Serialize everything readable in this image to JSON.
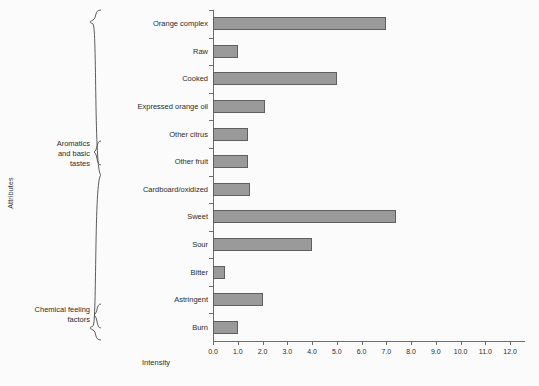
{
  "chart_data": {
    "type": "bar",
    "orientation": "horizontal",
    "title": "",
    "xlabel": "Intensity",
    "ylabel": "Attributes",
    "xlim": [
      0.0,
      12.6
    ],
    "ylim": null,
    "grid": false,
    "legend": null,
    "xticks": [
      "0.0",
      "1.0",
      "2.0",
      "3.0",
      "4.0",
      "5.0",
      "6.0",
      "7.0",
      "8.0",
      "9.0",
      "10.0",
      "11.0",
      "12.0"
    ],
    "xtick_values": [
      0,
      1,
      2,
      3,
      4,
      5,
      6,
      7,
      8,
      9,
      10,
      11,
      12
    ],
    "categories": [
      "Orange complex",
      "Raw",
      "Cooked",
      "Expressed orange oil",
      "Other citrus",
      "Other fruit",
      "Cardboard/oxidized",
      "Sweet",
      "Sour",
      "Bitter",
      "Astringent",
      "Burn"
    ],
    "values": [
      7.0,
      1.0,
      5.0,
      2.1,
      1.4,
      1.4,
      1.5,
      7.4,
      4.0,
      0.5,
      2.0,
      1.0
    ],
    "bar_color": "#9a9a9a",
    "bar_edge_color": "#5f5f5f",
    "groups": [
      {
        "name": "Aromatics\nand basic\ntastes",
        "from": 0,
        "to": 9
      },
      {
        "name": "Chemical feeling\nfactors",
        "from": 10,
        "to": 11
      }
    ]
  }
}
